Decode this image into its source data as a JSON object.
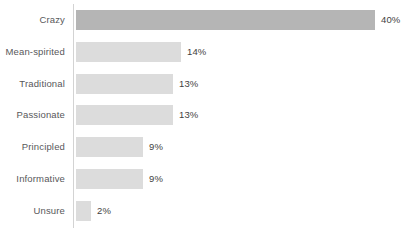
{
  "chart_data": {
    "type": "bar",
    "orientation": "horizontal",
    "title": "",
    "subtitle": "",
    "xlabel": "",
    "ylabel": "",
    "grid": false,
    "legend": null,
    "xlim": [
      0,
      44
    ],
    "categories": [
      "Crazy",
      "Mean-spirited",
      "Traditional",
      "Passionate",
      "Principled",
      "Informative",
      "Unsure"
    ],
    "values": [
      40,
      14,
      13,
      13,
      9,
      9,
      2
    ],
    "value_labels": [
      "40%",
      "14%",
      "13%",
      "13%",
      "9%",
      "9%",
      "2%"
    ],
    "bar_colors": [
      "#b5b5b5",
      "#dcdcdc",
      "#dcdcdc",
      "#dcdcdc",
      "#dcdcdc",
      "#dcdcdc",
      "#dcdcdc"
    ],
    "highlight_index": 0,
    "label_color": "#58585a",
    "value_color": "#3f3f41",
    "axis_color": "#d3d3d3",
    "background": "#ffffff"
  },
  "rows": [
    {
      "label": "Crazy",
      "value_label": "40%"
    },
    {
      "label": "Mean-spirited",
      "value_label": "14%"
    },
    {
      "label": "Traditional",
      "value_label": "13%"
    },
    {
      "label": "Passionate",
      "value_label": "13%"
    },
    {
      "label": "Principled",
      "value_label": "9%"
    },
    {
      "label": "Informative",
      "value_label": "9%"
    },
    {
      "label": "Unsure",
      "value_label": "2%"
    }
  ]
}
